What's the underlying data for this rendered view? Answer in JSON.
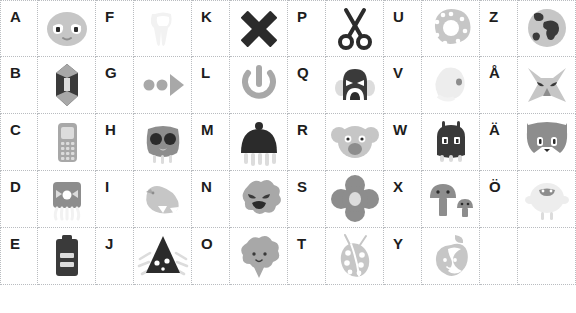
{
  "page": {
    "background_color": "#ffffff",
    "grid_line_color": "#b9bcc0",
    "letter_color": "#1d1d1d",
    "columns": 5,
    "rows": 5,
    "cell_width_letter": 38,
    "cell_width_icon": 58,
    "cell_height": 57
  },
  "palette": {
    "dark": "#3a3a3a",
    "near_black": "#2b2b2b",
    "mid_gray": "#8d8d8d",
    "gray": "#a8a8a8",
    "light_gray": "#c6c6c6",
    "pale_gray": "#dcdcdc",
    "very_pale": "#ededed",
    "ghost": "#f2f2f2",
    "white": "#ffffff"
  },
  "cells": [
    {
      "letter": "A",
      "icon": "alien-face-icon",
      "label": "alien face",
      "tone": "light_gray"
    },
    {
      "letter": "F",
      "icon": "tooth-icon",
      "label": "tooth",
      "tone": "ghost"
    },
    {
      "letter": "K",
      "icon": "cross-x-icon",
      "label": "black cross",
      "tone": "near_black"
    },
    {
      "letter": "P",
      "icon": "scissors-icon",
      "label": "scissors",
      "tone": "near_black"
    },
    {
      "letter": "U",
      "icon": "donut-icon",
      "label": "donut",
      "tone": "light_gray"
    },
    {
      "letter": "Z",
      "icon": "globe-icon",
      "label": "earth globe",
      "tone": "mid_gray"
    },
    {
      "letter": "B",
      "icon": "crystal-icon",
      "label": "crystal gem",
      "tone": "dark"
    },
    {
      "letter": "G",
      "icon": "play-dots-icon",
      "label": "dots and arrow",
      "tone": "gray"
    },
    {
      "letter": "L",
      "icon": "power-icon",
      "label": "power symbol",
      "tone": "gray"
    },
    {
      "letter": "Q",
      "icon": "monster-face-icon",
      "label": "shouting monster",
      "tone": "dark"
    },
    {
      "letter": "V",
      "icon": "ghost-bird-icon",
      "label": "pale ghost bird",
      "tone": "very_pale"
    },
    {
      "letter": "Å",
      "icon": "fox-head-icon",
      "label": "angular fox head",
      "tone": "light_gray"
    },
    {
      "letter": "C",
      "icon": "mobile-phone-icon",
      "label": "mobile phone",
      "tone": "gray"
    },
    {
      "letter": "H",
      "icon": "owl-face-icon",
      "label": "owl face",
      "tone": "mid_gray"
    },
    {
      "letter": "M",
      "icon": "jellyfish-icon",
      "label": "jellyfish",
      "tone": "near_black"
    },
    {
      "letter": "R",
      "icon": "koala-face-icon",
      "label": "koala face",
      "tone": "light_gray"
    },
    {
      "letter": "W",
      "icon": "beetle-icon",
      "label": "dark beetle",
      "tone": "dark"
    },
    {
      "letter": "Ä",
      "icon": "cat-head-icon",
      "label": "cat head",
      "tone": "mid_gray"
    },
    {
      "letter": "D",
      "icon": "squid-robot-icon",
      "label": "square squid",
      "tone": "mid_gray"
    },
    {
      "letter": "I",
      "icon": "bird-icon",
      "label": "flying bird",
      "tone": "light_gray"
    },
    {
      "letter": "N",
      "icon": "cloud-face-icon",
      "label": "grumpy cloud",
      "tone": "gray"
    },
    {
      "letter": "S",
      "icon": "flower-icon",
      "label": "four-petal flower",
      "tone": "mid_gray"
    },
    {
      "letter": "X",
      "icon": "mushrooms-icon",
      "label": "two mushrooms",
      "tone": "mid_gray"
    },
    {
      "letter": "Ö",
      "icon": "sheep-icon",
      "label": "pale sheep",
      "tone": "very_pale"
    },
    {
      "letter": "E",
      "icon": "battery-icon",
      "label": "battery",
      "tone": "dark"
    },
    {
      "letter": "J",
      "icon": "cone-creature-icon",
      "label": "spiky cone",
      "tone": "near_black"
    },
    {
      "letter": "O",
      "icon": "broccoli-icon",
      "label": "broccoli",
      "tone": "gray"
    },
    {
      "letter": "T",
      "icon": "ladybug-icon",
      "label": "ladybug",
      "tone": "light_gray"
    },
    {
      "letter": "Y",
      "icon": "apple-icon",
      "label": "bitten apple",
      "tone": "light_gray"
    },
    {
      "letter": "",
      "icon": "",
      "label": "empty cell",
      "tone": "white"
    }
  ]
}
